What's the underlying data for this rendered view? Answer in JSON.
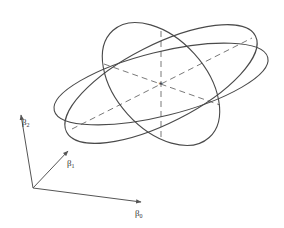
{
  "diagram": {
    "center_marker": "*",
    "axes": [
      {
        "symbol": "β",
        "subscript": "2",
        "direction": "up"
      },
      {
        "symbol": "β",
        "subscript": "1",
        "direction": "depth"
      },
      {
        "symbol": "β",
        "subscript": "0",
        "direction": "right"
      }
    ],
    "ellipse_count": 3,
    "principal_axis_count": 3,
    "colors": {
      "curves": "#4a4a4a",
      "dashed_axes": "#6a6a6a",
      "background": "#ffffff"
    }
  }
}
